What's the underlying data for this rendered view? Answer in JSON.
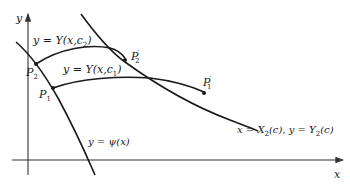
{
  "figure": {
    "axes": {
      "x_label": "x",
      "y_label": "y"
    },
    "curves": {
      "psi": {
        "label_lhs": "y = ",
        "label_fn": "ψ(x)",
        "full_label": "y = ψ(x)"
      },
      "family_c1": {
        "label_pre": "y = Y(x,c",
        "label_sub": "1",
        "label_post": ")",
        "full_label": "y = Y(x,c1)"
      },
      "family_c2": {
        "label_pre": "y = Y(x,c",
        "label_sub": "2",
        "label_post": ")",
        "full_label": "y = Y(x,c2)"
      },
      "transversal": {
        "label_a_pre": "x = X",
        "label_a_sub": "2",
        "label_a_post": "(c), y = Y",
        "label_b_sub": "2",
        "label_b_post": "(c)",
        "full_label": "x = X2(c), y = Y2(c)"
      }
    },
    "points": {
      "P1": {
        "base": "P",
        "sub": "1",
        "prime": ""
      },
      "P2": {
        "base": "P",
        "sub": "2",
        "prime": ""
      },
      "P1_prime": {
        "base": "P",
        "sub": "1",
        "prime": "′"
      },
      "P2_prime": {
        "base": "P",
        "sub": "2",
        "prime": "′"
      }
    },
    "colors": {
      "ink": "#1a1a1a",
      "background": "#ffffff"
    }
  }
}
